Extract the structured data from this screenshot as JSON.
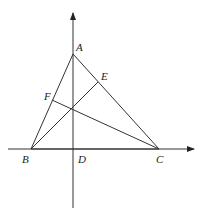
{
  "diagram": {
    "type": "geometry",
    "points": {
      "A": {
        "label": "A",
        "x": 73,
        "y": 54
      },
      "B": {
        "label": "B",
        "x": 31,
        "y": 149
      },
      "C": {
        "label": "C",
        "x": 159,
        "y": 149
      },
      "D": {
        "label": "D",
        "x": 73,
        "y": 149
      },
      "E": {
        "label": "E",
        "x": 98,
        "y": 82
      },
      "F": {
        "label": "F",
        "x": 52,
        "y": 100
      },
      "H": {
        "x": 73,
        "y": 108
      }
    },
    "segments": [
      [
        "A",
        "B"
      ],
      [
        "A",
        "C"
      ],
      [
        "B",
        "C"
      ],
      [
        "B",
        "E"
      ],
      [
        "C",
        "F"
      ],
      [
        "A",
        "D"
      ]
    ],
    "axes": {
      "x_axis": {
        "from": [
          8,
          149
        ],
        "to": [
          195,
          149
        ],
        "arrow": true
      },
      "y_axis": {
        "from": [
          73,
          208
        ],
        "to": [
          73,
          12
        ],
        "arrow": true
      }
    },
    "labels": {
      "A": "A",
      "B": "B",
      "C": "C",
      "D": "D",
      "E": "E",
      "F": "F"
    }
  }
}
